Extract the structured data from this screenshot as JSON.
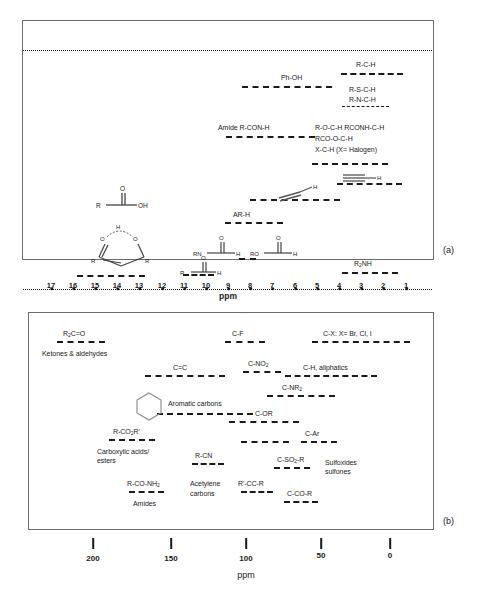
{
  "figure": {
    "panels": [
      {
        "tag": "(a)",
        "axis_label": "ppm"
      },
      {
        "tag": "(b)",
        "axis_label": "ppm"
      }
    ]
  },
  "panel_a": {
    "tag": "(a)",
    "axis": {
      "label": "ppm",
      "ticks": [
        17,
        16,
        15,
        14,
        13,
        12,
        11,
        10,
        9,
        8,
        7,
        6,
        5,
        4,
        3,
        2,
        1
      ],
      "min": 1,
      "max": 17,
      "direction": "decreasing-left-to-right"
    },
    "ranges": [
      {
        "label": "R-C-H",
        "from": 2.0,
        "to": 0.6
      },
      {
        "label": "Ph-OH",
        "from": 9.2,
        "to": 5.3
      },
      {
        "label": "R-S-C-H",
        "from": 2.2,
        "to": 1.0
      },
      {
        "label": "R-N-C-H",
        "from": 3.0,
        "to": 1.8
      },
      {
        "label": "Amide R-CON-H",
        "from": 9.6,
        "to": 6.0
      },
      {
        "label": "R-O-C-H  RCONH-C-H",
        "from": 4.5,
        "to": 2.6
      },
      {
        "label": "RCO-O-C-H",
        "from": 4.5,
        "to": 2.6
      },
      {
        "label": "X-C-H (X= Halogen)",
        "from": 4.5,
        "to": 2.6
      },
      {
        "label": "AR-H",
        "from": 8.6,
        "to": 6.4
      },
      {
        "label": "alkene-H",
        "from": 7.3,
        "to": 4.2
      },
      {
        "label": "alkyne-H",
        "from": 3.4,
        "to": 1.6
      },
      {
        "label": "aldehyde-H",
        "from": 10.6,
        "to": 9.5
      },
      {
        "label": "formyl-H",
        "from": 8.4,
        "to": 7.9
      },
      {
        "label": "carboxylic-OH",
        "from": 15.4,
        "to": 12.4
      },
      {
        "label": "R2NH",
        "from": 3.3,
        "to": 1.1
      }
    ],
    "labels": {
      "ph_oh": "Ph-OH",
      "r_c_h": "R-C-H",
      "r_s_c_h": "R-S-C-H",
      "r_n_c_h": "R-N-C-H",
      "amide": "Amide R-CON-H",
      "r_o_c_h": "R-O-C-H  RCONH-C-H",
      "rco_o_c_h": "RCO-O-C-H",
      "x_c_h": "X-C-H (X= Halogen)",
      "ar_h": "AR-H",
      "r2nh_r": "R",
      "r2nh_sub": "2",
      "r2nh_nh": "NH"
    },
    "structures": {
      "carboxylic_acid": {
        "r": "R",
        "o": "O",
        "oh": "OH"
      },
      "enol_ring": {
        "h": "H",
        "o_left": "O",
        "o_right": "O",
        "r_left": "R",
        "r_right": "R"
      },
      "amide_aldehyde": {
        "rn": "RN",
        "o": "O",
        "h": "H"
      },
      "formate": {
        "ro": "RO",
        "o": "O",
        "h": "H"
      },
      "aldehyde": {
        "r": "R",
        "o": "O",
        "h": "H"
      },
      "alkene": {
        "h": "H"
      },
      "alkyne": {
        "h": "H"
      }
    }
  },
  "panel_b": {
    "tag": "(b)",
    "axis": {
      "label": "ppm",
      "ticks": [
        200,
        150,
        100,
        50,
        0
      ],
      "min": 0,
      "max": 220,
      "direction": "decreasing-left-to-right"
    },
    "ranges": [
      {
        "label": "R2C=O / Ketones & aldehydes",
        "from": 215,
        "to": 190
      },
      {
        "label": "C-F",
        "from": 115,
        "to": 90
      },
      {
        "label": "C-X: X= Br, Cl, I",
        "from": 80,
        "to": 5
      },
      {
        "label": "C=C",
        "from": 160,
        "to": 110
      },
      {
        "label": "C-NO2",
        "from": 95,
        "to": 70
      },
      {
        "label": "C-H, aliphatics",
        "from": 70,
        "to": 3
      },
      {
        "label": "C-NR2",
        "from": 72,
        "to": 40
      },
      {
        "label": "Aromatic carbons",
        "from": 158,
        "to": 102
      },
      {
        "label": "C-OR",
        "from": 95,
        "to": 55
      },
      {
        "label": "R-CO2R' / Carboxylic acids/esters",
        "from": 185,
        "to": 165
      },
      {
        "label": "C-SO2-R (upper)",
        "from": 85,
        "to": 60
      },
      {
        "label": "C-Ar",
        "from": 48,
        "to": 30
      },
      {
        "label": "R-CN",
        "from": 128,
        "to": 110
      },
      {
        "label": "C-SO2-R",
        "from": 58,
        "to": 40
      },
      {
        "label": "R-CO-NH2 / Amides",
        "from": 180,
        "to": 165
      },
      {
        "label": "R'-CC-R / Acetylene carbons",
        "from": 92,
        "to": 70
      },
      {
        "label": "C-CO-R",
        "from": 48,
        "to": 28
      }
    ],
    "labels": {
      "r2co_r": "R",
      "r2co_sub": "2",
      "r2co_rest": "C=O",
      "ketones": "Ketones & aldehydes",
      "c_f": "C-F",
      "c_x": "C-X: X= Br, Cl, I",
      "c_c": "C=C",
      "c_no2_base": "C-NO",
      "c_no2_sub": "2",
      "c_h_aliphatics": "C-H, aliphatics",
      "c_nr2_base": "C-NR",
      "c_nr2_sub": "2",
      "aromatic_carbons": "Aromatic carbons",
      "c_or": "C-OR",
      "c_ar": "C-Ar",
      "rco2r_base": "R-CO",
      "rco2r_sub": "2",
      "rco2r_rest": "R'",
      "carboxylic_l1": "Carboxylic acids/",
      "carboxylic_l2": "esters",
      "r_cn": "R-CN",
      "c_so2r_base": "C-SO",
      "c_so2r_sub": "2",
      "c_so2r_rest": "-R",
      "sulfoxides_l1": "Sulfoxides",
      "sulfoxides_l2": "sulfones",
      "rconh2_base": "R-CO-NH",
      "rconh2_sub": "2",
      "amides": "Amides",
      "acetylene_l1": "Acetylene",
      "acetylene_l2": "carbons",
      "r_cc_r": "R'-CC-R",
      "c_co_r": "C-CO-R"
    }
  },
  "colors": {
    "ink": "#1a1a1a",
    "frame": "#6b6b6b",
    "background": "#ffffff"
  }
}
